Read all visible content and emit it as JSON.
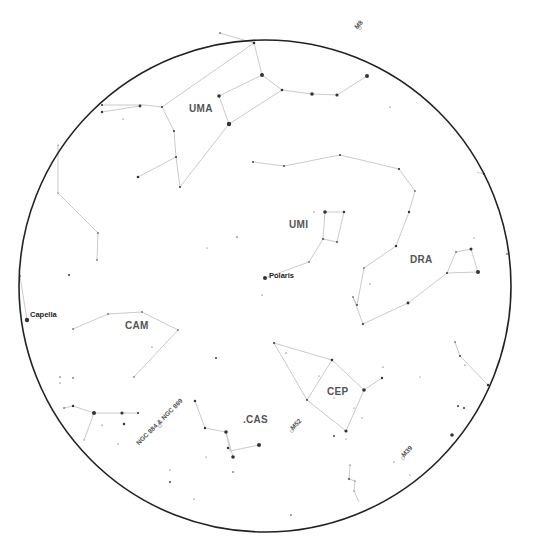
{
  "chart": {
    "center": [
      265,
      286
    ],
    "radius": 246,
    "line_color": "#c4c4c4",
    "star_color": "#333333",
    "horizon_color": "#222222"
  },
  "constellations": [
    {
      "abbr": "UMA",
      "label_pos": [
        189,
        113
      ]
    },
    {
      "abbr": "UMI",
      "label_pos": [
        289,
        229
      ]
    },
    {
      "abbr": "DRA",
      "label_pos": [
        410,
        264
      ]
    },
    {
      "abbr": "CAM",
      "label_pos": [
        125,
        330
      ]
    },
    {
      "abbr": "CEP",
      "label_pos": [
        327,
        396
      ]
    },
    {
      "abbr": ".CAS",
      "label_pos": [
        243,
        424
      ]
    }
  ],
  "named_stars": [
    {
      "name": "Polaris",
      "pos": [
        265,
        278
      ],
      "label_pos": [
        269,
        279
      ]
    },
    {
      "name": "Capella",
      "pos": [
        27,
        320
      ],
      "label_pos": [
        30,
        318
      ]
    }
  ],
  "deep_sky": [
    {
      "name": "M52",
      "pos": [
        292,
        431
      ],
      "label_pos": [
        294,
        431
      ],
      "rotate": -45
    },
    {
      "name": "M39",
      "pos": [
        403,
        458
      ],
      "label_pos": [
        405,
        458
      ],
      "rotate": -45
    },
    {
      "name": "NGC 884 & NGC 869",
      "pos": [
        160,
        426
      ],
      "label_pos": [
        140,
        446
      ],
      "rotate": -45
    },
    {
      "name": "M8",
      "pos": [
        360,
        28
      ],
      "label_pos": [
        358,
        30
      ],
      "rotate": -45
    }
  ],
  "lines": [
    [
      [
        220,
        33
      ],
      [
        254,
        43
      ],
      [
        262,
        75
      ],
      [
        282,
        90
      ],
      [
        229,
        124
      ],
      [
        219,
        96
      ],
      [
        262,
        75
      ]
    ],
    [
      [
        254,
        43
      ],
      [
        162,
        107
      ],
      [
        145,
        105
      ],
      [
        102,
        105
      ]
    ],
    [
      [
        102,
        112
      ],
      [
        140,
        106
      ]
    ],
    [
      [
        162,
        107
      ],
      [
        174,
        131
      ],
      [
        176,
        157
      ],
      [
        138,
        177
      ]
    ],
    [
      [
        229,
        124
      ],
      [
        180,
        187
      ],
      [
        176,
        157
      ]
    ],
    [
      [
        282,
        90
      ],
      [
        312,
        94
      ],
      [
        337,
        95
      ],
      [
        367,
        76
      ]
    ],
    [
      [
        253,
        162
      ],
      [
        284,
        166
      ],
      [
        340,
        155
      ],
      [
        399,
        169
      ],
      [
        415,
        191
      ],
      [
        409,
        212
      ],
      [
        396,
        246
      ],
      [
        364,
        268
      ],
      [
        357,
        305
      ],
      [
        353,
        297
      ],
      [
        363,
        324
      ],
      [
        408,
        303
      ],
      [
        447,
        273
      ],
      [
        478,
        272
      ],
      [
        471,
        249
      ],
      [
        456,
        252
      ],
      [
        447,
        273
      ]
    ],
    [
      [
        477,
        172
      ],
      [
        484,
        174
      ]
    ],
    [
      [
        325,
        212
      ],
      [
        344,
        212
      ],
      [
        337,
        242
      ],
      [
        323,
        239
      ],
      [
        325,
        212
      ]
    ],
    [
      [
        323,
        239
      ],
      [
        309,
        262
      ],
      [
        265,
        278
      ]
    ],
    [
      [
        58,
        145
      ],
      [
        58,
        193
      ],
      [
        98,
        233
      ],
      [
        97,
        260
      ]
    ],
    [
      [
        20,
        276
      ],
      [
        27,
        320
      ]
    ],
    [
      [
        73,
        329
      ],
      [
        108,
        314
      ],
      [
        142,
        312
      ],
      [
        178,
        330
      ],
      [
        134,
        377
      ]
    ],
    [
      [
        274,
        343
      ],
      [
        332,
        360
      ],
      [
        364,
        390
      ],
      [
        346,
        431
      ],
      [
        307,
        400
      ],
      [
        274,
        343
      ]
    ],
    [
      [
        332,
        360
      ],
      [
        307,
        400
      ]
    ],
    [
      [
        364,
        390
      ],
      [
        382,
        378
      ]
    ],
    [
      [
        64,
        408
      ],
      [
        73,
        406
      ],
      [
        94,
        413
      ],
      [
        122,
        413
      ],
      [
        138,
        413
      ]
    ],
    [
      [
        94,
        413
      ],
      [
        84,
        440
      ]
    ],
    [
      [
        195,
        401
      ],
      [
        205,
        428
      ],
      [
        226,
        432
      ],
      [
        230,
        451
      ],
      [
        259,
        445
      ]
    ],
    [
      [
        226,
        432
      ],
      [
        233,
        457
      ]
    ],
    [
      [
        455,
        342
      ],
      [
        460,
        356
      ],
      [
        488,
        385
      ]
    ],
    [
      [
        350,
        465
      ],
      [
        349,
        479
      ],
      [
        355,
        481
      ],
      [
        354,
        491
      ],
      [
        359,
        502
      ]
    ]
  ],
  "stars": [
    [
      254,
      43,
      1.3
    ],
    [
      262,
      75,
      2.0
    ],
    [
      282,
      90,
      1.3
    ],
    [
      229,
      124,
      2.2
    ],
    [
      219,
      96,
      1.8
    ],
    [
      220,
      33,
      0.8
    ],
    [
      162,
      107,
      1.0
    ],
    [
      140,
      106,
      1.4
    ],
    [
      102,
      105,
      1.0
    ],
    [
      102,
      112,
      1.2
    ],
    [
      174,
      131,
      1.0
    ],
    [
      176,
      157,
      1.0
    ],
    [
      138,
      177,
      1.3
    ],
    [
      180,
      187,
      1.0
    ],
    [
      123,
      119,
      0.6
    ],
    [
      312,
      94,
      1.8
    ],
    [
      337,
      95,
      1.6
    ],
    [
      367,
      76,
      2.0
    ],
    [
      391,
      75,
      0.6
    ],
    [
      390,
      107,
      0.6
    ],
    [
      253,
      162,
      0.9
    ],
    [
      284,
      166,
      0.9
    ],
    [
      340,
      155,
      0.9
    ],
    [
      399,
      169,
      1.1
    ],
    [
      415,
      191,
      0.8
    ],
    [
      409,
      212,
      1.2
    ],
    [
      396,
      246,
      1.2
    ],
    [
      364,
      268,
      0.8
    ],
    [
      357,
      305,
      0.9
    ],
    [
      353,
      297,
      0.8
    ],
    [
      363,
      324,
      1.1
    ],
    [
      408,
      303,
      1.4
    ],
    [
      447,
      273,
      1.0
    ],
    [
      478,
      272,
      2.0
    ],
    [
      471,
      249,
      1.5
    ],
    [
      456,
      252,
      0.8
    ],
    [
      370,
      284,
      0.6
    ],
    [
      484,
      174,
      1.0
    ],
    [
      507,
      254,
      0.8
    ],
    [
      325,
      212,
      1.8
    ],
    [
      344,
      212,
      1.2
    ],
    [
      337,
      242,
      0.9
    ],
    [
      323,
      239,
      0.9
    ],
    [
      314,
      212,
      0.6
    ],
    [
      309,
      262,
      0.8
    ],
    [
      265,
      278,
      2.0
    ],
    [
      262,
      295,
      0.6
    ],
    [
      237,
      237,
      0.7
    ],
    [
      58,
      145,
      0.6
    ],
    [
      58,
      193,
      0.6
    ],
    [
      98,
      233,
      0.8
    ],
    [
      97,
      260,
      0.8
    ],
    [
      69,
      275,
      1.0
    ],
    [
      20,
      276,
      0.8
    ],
    [
      27,
      320,
      2.2
    ],
    [
      207,
      248,
      0.5
    ],
    [
      73,
      329,
      0.8
    ],
    [
      108,
      314,
      0.8
    ],
    [
      142,
      312,
      0.8
    ],
    [
      178,
      330,
      0.8
    ],
    [
      134,
      377,
      0.7
    ],
    [
      152,
      347,
      0.6
    ],
    [
      216,
      358,
      1.0
    ],
    [
      60,
      377,
      0.7
    ],
    [
      73,
      378,
      0.8
    ],
    [
      60,
      383,
      0.6
    ],
    [
      64,
      408,
      0.8
    ],
    [
      73,
      406,
      1.2
    ],
    [
      94,
      413,
      2.0
    ],
    [
      122,
      413,
      1.6
    ],
    [
      138,
      413,
      1.1
    ],
    [
      124,
      424,
      1.2
    ],
    [
      102,
      425,
      0.6
    ],
    [
      118,
      444,
      0.6
    ],
    [
      84,
      440,
      0.5
    ],
    [
      195,
      401,
      1.2
    ],
    [
      205,
      428,
      1.2
    ],
    [
      226,
      432,
      1.8
    ],
    [
      228,
      448,
      1.2
    ],
    [
      233,
      457,
      1.8
    ],
    [
      259,
      445,
      2.0
    ],
    [
      206,
      457,
      0.5
    ],
    [
      233,
      472,
      0.8
    ],
    [
      170,
      470,
      0.6
    ],
    [
      170,
      482,
      0.9
    ],
    [
      194,
      499,
      0.6
    ],
    [
      274,
      343,
      1.0
    ],
    [
      286,
      353,
      0.6
    ],
    [
      332,
      360,
      1.3
    ],
    [
      364,
      390,
      1.8
    ],
    [
      382,
      378,
      1.2
    ],
    [
      383,
      367,
      0.6
    ],
    [
      346,
      431,
      1.6
    ],
    [
      307,
      400,
      0.9
    ],
    [
      334,
      398,
      0.5
    ],
    [
      354,
      408,
      0.5
    ],
    [
      362,
      418,
      0.5
    ],
    [
      334,
      436,
      0.9
    ],
    [
      346,
      439,
      0.5
    ],
    [
      319,
      376,
      0.5
    ],
    [
      420,
      377,
      0.5
    ],
    [
      455,
      342,
      0.8
    ],
    [
      460,
      356,
      0.9
    ],
    [
      465,
      365,
      0.6
    ],
    [
      488,
      385,
      1.2
    ],
    [
      458,
      406,
      1.0
    ],
    [
      464,
      408,
      1.0
    ],
    [
      452,
      435,
      1.8
    ],
    [
      394,
      462,
      0.6
    ],
    [
      410,
      475,
      0.5
    ],
    [
      350,
      465,
      0.6
    ],
    [
      349,
      479,
      0.9
    ],
    [
      355,
      481,
      0.6
    ],
    [
      354,
      491,
      0.6
    ],
    [
      291,
      515,
      0.8
    ],
    [
      474,
      238,
      0.5
    ]
  ]
}
